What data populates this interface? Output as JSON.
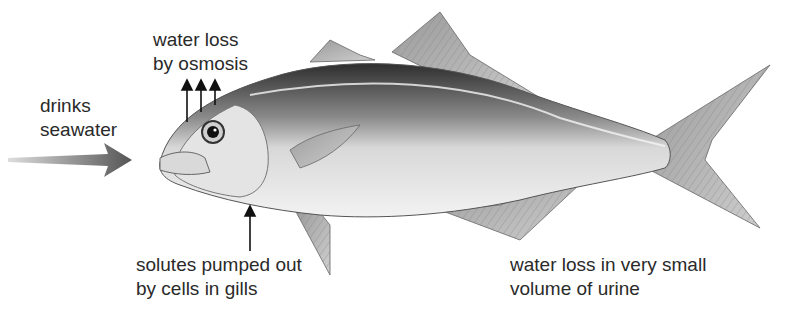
{
  "diagram": {
    "labels": {
      "drinks": {
        "line1": "drinks",
        "line2": "seawater"
      },
      "osmosis": {
        "line1": "water loss",
        "line2": "by osmosis"
      },
      "gills": {
        "line1": "solutes pumped out",
        "line2": "by cells in gills"
      },
      "urine": {
        "line1": "water loss in very small",
        "line2": "volume of urine"
      }
    },
    "colors": {
      "text": "#2a2a2a",
      "arrow": "#555555",
      "fish_dark": "#3a3a3a",
      "fish_light": "#e8e8e8"
    }
  }
}
